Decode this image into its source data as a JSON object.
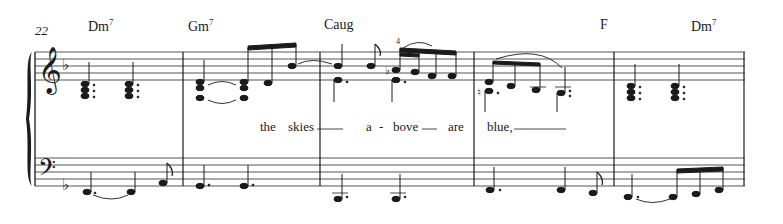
{
  "score": {
    "measure_number": "22",
    "key_signature": "F major (1 flat)",
    "clefs": {
      "treble": "treble-clef",
      "bass": "bass-clef"
    },
    "chords": [
      {
        "root": "Dm",
        "ext": "7",
        "x": 88
      },
      {
        "root": "Gm",
        "ext": "7",
        "x": 188
      },
      {
        "root": "Caug",
        "ext": "",
        "x": 324
      },
      {
        "root": "F",
        "ext": "",
        "x": 600
      },
      {
        "root": "Dm",
        "ext": "7",
        "x": 691
      }
    ],
    "lyrics": [
      {
        "text": "the",
        "x": 260
      },
      {
        "text": "skies",
        "x": 288
      },
      {
        "text": "a",
        "x": 365
      },
      {
        "text": "-",
        "x": 377
      },
      {
        "text": "bove",
        "x": 393
      },
      {
        "text": "are",
        "x": 448
      },
      {
        "text": "blue,",
        "x": 487
      }
    ],
    "fingering": "4",
    "colors": {
      "ink": "#1a1a1a",
      "staff_line": "#555555",
      "background": "#ffffff"
    }
  }
}
